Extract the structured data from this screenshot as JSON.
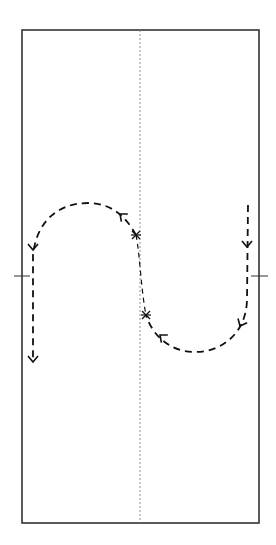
{
  "diagram": {
    "type": "motion-path",
    "colors": {
      "frame": "#333333",
      "center_line": "#777777",
      "path": "#111111",
      "background": "#ffffff"
    },
    "frame": {
      "x": 22,
      "y": 30,
      "width": 237,
      "height": 493
    },
    "center_line": {
      "x": 140,
      "y1": 30,
      "y2": 523,
      "style": "dashed"
    },
    "ticks": [
      {
        "side": "left",
        "x1": 14,
        "x2": 30,
        "y": 276
      },
      {
        "side": "right",
        "x1": 251,
        "x2": 268,
        "y": 276
      }
    ],
    "paths": [
      {
        "id": "upper-left-loop",
        "d": "M 136 235 C 125 215, 110 203, 88 203 C 55 203, 36 225, 33 255 L 33 362"
      },
      {
        "id": "right-lower-loop",
        "d": "M 248 205 L 247 300 C 246 335, 220 352, 195 352 C 170 352, 152 335, 146 315"
      },
      {
        "id": "center-connector",
        "d": "M 136 235 C 140 255, 141 290, 146 315"
      }
    ],
    "arrows": [
      {
        "x": 120,
        "y": 214,
        "direction": "up-left",
        "angle": -140
      },
      {
        "x": 33,
        "y": 250,
        "direction": "down",
        "angle": 90
      },
      {
        "x": 33,
        "y": 362,
        "direction": "down",
        "angle": 90
      },
      {
        "x": 247,
        "y": 247,
        "direction": "down",
        "angle": 90
      },
      {
        "x": 240,
        "y": 326,
        "direction": "down-left",
        "angle": 115
      },
      {
        "x": 160,
        "y": 335,
        "direction": "up-left",
        "angle": -140
      }
    ],
    "cross_marks": [
      {
        "x": 136,
        "y": 235
      },
      {
        "x": 146,
        "y": 315
      }
    ]
  }
}
